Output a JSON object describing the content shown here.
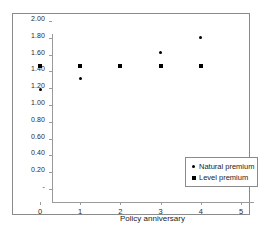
{
  "chart_data": {
    "type": "scatter",
    "title": "",
    "xlabel": "Policy anniversary",
    "ylabel": "",
    "xlim": [
      0,
      5
    ],
    "ylim": [
      0,
      2.0
    ],
    "grid": false,
    "legend_position": "bottom-right",
    "x_ticks": [
      "0",
      "1",
      "2",
      "3",
      "4",
      "5"
    ],
    "x_tick_values": [
      0,
      1,
      2,
      3,
      4,
      5
    ],
    "y_ticks": [
      "-",
      "0.20",
      "0.40",
      "0.60",
      "0.80",
      "1.00",
      "1.20",
      "1.40",
      "1.60",
      "1.80",
      "2.00"
    ],
    "y_tick_values": [
      0,
      0.2,
      0.4,
      0.6,
      0.8,
      1.0,
      1.2,
      1.4,
      1.6,
      1.8,
      2.0
    ],
    "x": [
      0,
      1,
      2,
      3,
      4
    ],
    "series": [
      {
        "name": "Natural premium",
        "marker": "dot",
        "color": "#000000",
        "values": [
          1.19,
          1.32,
          1.46,
          1.62,
          1.8
        ]
      },
      {
        "name": "Level premium",
        "marker": "square",
        "color": "#000000",
        "values": [
          1.46,
          1.46,
          1.46,
          1.47,
          1.47
        ]
      }
    ]
  },
  "legend": {
    "entries": [
      {
        "label": "Natural premium",
        "marker": "dot"
      },
      {
        "label": "Level premium",
        "marker": "square"
      }
    ]
  },
  "colors": {
    "frame": "#8a8a8a",
    "axis": "#9b9b9b",
    "marker": "#000000",
    "text": "#1c1c1c",
    "background": "#ffffff"
  }
}
